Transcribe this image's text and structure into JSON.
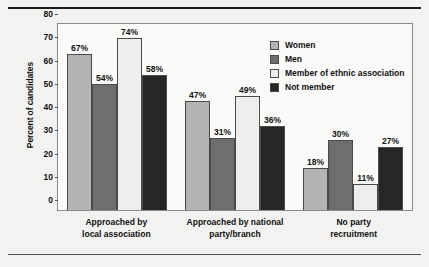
{
  "chart_data": {
    "type": "bar",
    "title": "",
    "xlabel": "",
    "ylabel": "Percent of candidates",
    "ylim": [
      0,
      80
    ],
    "yticks": [
      0,
      10,
      20,
      30,
      40,
      50,
      60,
      70,
      80
    ],
    "grid": false,
    "legend_position": "upper right",
    "value_suffix": "%",
    "categories": [
      "Approached by\nlocal association",
      "Approached by national\nparty/branch",
      "No party\nrecruitment"
    ],
    "categories_lines": [
      [
        "Approached by",
        "local association"
      ],
      [
        "Approached by national",
        "party/branch"
      ],
      [
        "No party",
        "recruitment"
      ]
    ],
    "series": [
      {
        "name": "Women",
        "color": "#b4b4b4",
        "values": [
          67,
          47,
          18
        ],
        "labels": [
          "67%",
          "47%",
          "18%"
        ]
      },
      {
        "name": "Men",
        "color": "#6e6e6e",
        "values": [
          54,
          31,
          30
        ],
        "labels": [
          "54%",
          "31%",
          "30%"
        ]
      },
      {
        "name": "Member of ethnic association",
        "color": "#eeeeec",
        "values": [
          74,
          49,
          11
        ],
        "labels": [
          "74%",
          "49%",
          "11%"
        ]
      },
      {
        "name": "Not member",
        "color": "#262626",
        "values": [
          58,
          36,
          27
        ],
        "labels": [
          "58%",
          "36%",
          "27%"
        ]
      }
    ]
  }
}
